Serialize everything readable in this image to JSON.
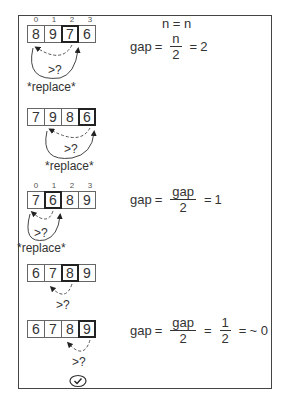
{
  "diagram": {
    "title_expr": "n = n",
    "steps": [
      {
        "indices": [
          "0",
          "1",
          "2",
          "3"
        ],
        "cells": [
          "8",
          "9",
          "7",
          "6"
        ],
        "highlight": 2,
        "compare_label": ">?",
        "action_label": "*replace*",
        "equation": {
          "lhs": "gap",
          "eq1": "=",
          "num": "n",
          "den": "2",
          "eq2": "=",
          "rhs": "2"
        }
      },
      {
        "cells": [
          "7",
          "9",
          "8",
          "6"
        ],
        "highlight": 3,
        "compare_label": ">?",
        "action_label": "*replace*"
      },
      {
        "indices": [
          "0",
          "1",
          "2",
          "3"
        ],
        "cells": [
          "7",
          "6",
          "8",
          "9"
        ],
        "highlight": 1,
        "compare_label": ">?",
        "action_label": "*replace*",
        "equation": {
          "lhs": "gap",
          "eq1": "=",
          "num": "gap",
          "den": "2",
          "eq2": "=",
          "rhs": "1"
        }
      },
      {
        "cells": [
          "6",
          "7",
          "8",
          "9"
        ],
        "highlight": 2,
        "compare_label": ">?"
      },
      {
        "cells": [
          "6",
          "7",
          "8",
          "9"
        ],
        "highlight": 3,
        "compare_label": ">?",
        "equation": {
          "lhs": "gap",
          "eq1": "=",
          "num": "gap",
          "den": "2",
          "eq2": "=",
          "num2": "1",
          "den2": "2",
          "eq3": "=",
          "rhs": "~ 0"
        }
      }
    ],
    "done_icon": "check-circle-icon",
    "colors": {
      "stroke": "#444444",
      "text": "#333333",
      "highlight_border": "#222222"
    }
  }
}
